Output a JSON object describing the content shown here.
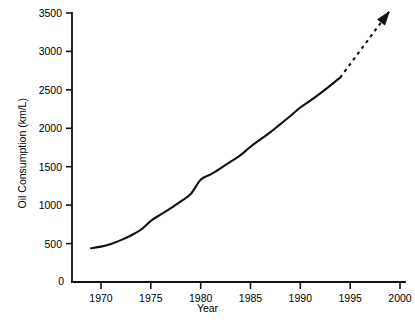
{
  "chart_data": {
    "type": "line",
    "title": "",
    "xlabel": "Year",
    "ylabel": "Oil Consumption (km/L)",
    "xlim": [
      1967.8,
      2001.2
    ],
    "ylim": [
      0,
      3500
    ],
    "grid": false,
    "legend": "none",
    "origin_label": "0",
    "x_ticks": [
      1970,
      1975,
      1980,
      1985,
      1990,
      1995,
      2000
    ],
    "x_tick_labels": [
      "1970",
      "1975",
      "1980",
      "1985",
      "1990",
      "1995",
      "2000"
    ],
    "y_ticks": [
      500,
      1000,
      1500,
      2000,
      2500,
      3000,
      3500
    ],
    "y_tick_labels": [
      "500",
      "1000",
      "1500",
      "2000",
      "2500",
      "3000",
      "3500"
    ],
    "series": [
      {
        "name": "Oil consumption (observed)",
        "style": "solid",
        "color": "#111111",
        "x": [
          1969.0,
          1970.0,
          1971.0,
          1972.0,
          1973.0,
          1974.0,
          1975.0,
          1976.0,
          1977.0,
          1978.0,
          1979.0,
          1980.0,
          1981.0,
          1982.0,
          1983.0,
          1984.0,
          1985.0,
          1986.0,
          1987.0,
          1988.0,
          1989.0,
          1990.0,
          1991.0,
          1992.0,
          1993.0,
          1994.0
        ],
        "y": [
          440,
          460,
          495,
          545,
          605,
          680,
          795,
          880,
          960,
          1050,
          1145,
          1330,
          1400,
          1480,
          1565,
          1650,
          1760,
          1855,
          1950,
          2055,
          2160,
          2270,
          2360,
          2455,
          2555,
          2660
        ]
      },
      {
        "name": "Oil consumption (projected)",
        "style": "dashed",
        "color": "#111111",
        "arrow": true,
        "x": [
          1994.0,
          1995.0,
          1996.0,
          1997.0,
          1998.0,
          1998.9
        ],
        "y": [
          2660,
          2835,
          3010,
          3185,
          3360,
          3515
        ]
      }
    ],
    "annotations": [
      {
        "name": "projection-arrowhead",
        "x": 1998.9,
        "y": 3515,
        "shape": "arrow-up-right"
      }
    ]
  },
  "axes": {
    "y_title": "Oil Consumption (km/L)",
    "x_title": "Year"
  }
}
